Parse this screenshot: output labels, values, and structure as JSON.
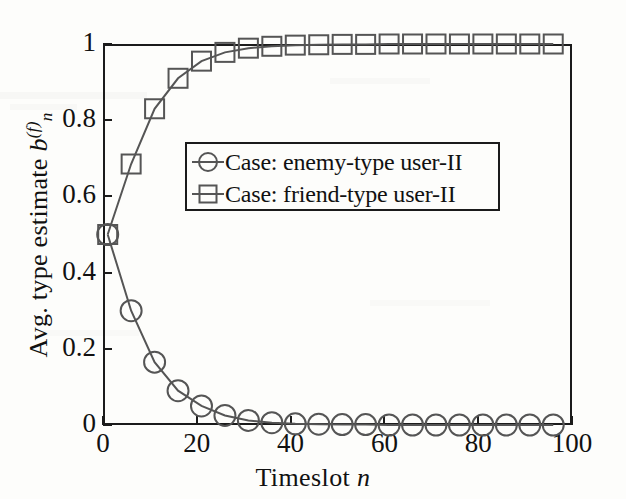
{
  "figure": {
    "background_color": "#fdfdfb",
    "axis_color": "#1b1b1b",
    "series_color": "#555555"
  },
  "axes": {
    "x_title_prefix": "Timeslot",
    "x_title_var": "n",
    "y_title_prefix": "Avg. type estimate",
    "y_title_var": "b",
    "y_title_sub": "n",
    "y_title_sup": "(f)",
    "x_ticks": [
      "0",
      "20",
      "40",
      "60",
      "80",
      "100"
    ],
    "y_ticks": [
      "0",
      "0.2",
      "0.4",
      "0.6",
      "0.8",
      "1"
    ]
  },
  "legend": {
    "position": "upper-center-left",
    "entries": [
      {
        "marker": "circle-marker-icon",
        "label": "Case: enemy-type user-II"
      },
      {
        "marker": "square-marker-icon",
        "label": "Case: friend-type user-II"
      }
    ]
  },
  "chart_data": {
    "type": "line",
    "title": "",
    "subtitle": "",
    "xlabel": "Timeslot n",
    "ylabel": "Avg. type estimate b_n^(f)",
    "xlim": [
      0,
      100
    ],
    "ylim": [
      0,
      1
    ],
    "grid": false,
    "legend_position": "upper-center-left",
    "x": [
      1,
      6,
      11,
      16,
      21,
      26,
      31,
      36,
      41,
      46,
      51,
      56,
      61,
      66,
      71,
      76,
      81,
      86,
      91,
      96
    ],
    "series": [
      {
        "name": "Case: enemy-type user-II",
        "marker": "circle",
        "color": "#555555",
        "values": [
          0.5,
          0.3,
          0.165,
          0.09,
          0.05,
          0.025,
          0.012,
          0.006,
          0.003,
          0.002,
          0.001,
          0.001,
          0.0,
          0.0,
          0.0,
          0.0,
          0.0,
          0.0,
          0.0,
          0.0
        ]
      },
      {
        "name": "Case: friend-type user-II",
        "marker": "square",
        "color": "#555555",
        "values": [
          0.5,
          0.685,
          0.83,
          0.91,
          0.955,
          0.978,
          0.989,
          0.994,
          0.997,
          0.998,
          0.999,
          0.999,
          1.0,
          1.0,
          1.0,
          1.0,
          1.0,
          1.0,
          1.0,
          1.0
        ]
      }
    ]
  }
}
